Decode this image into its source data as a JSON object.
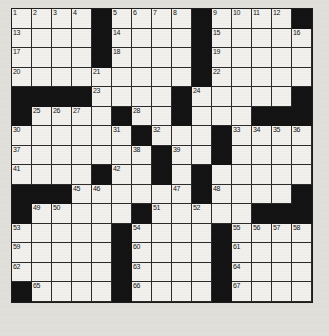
{
  "puzzle": {
    "type": "crossword-grid",
    "title": "Crossword Puzzle Grid",
    "columns": 15,
    "rows": 15,
    "colors": {
      "block": "#121212",
      "cell": "#f2f1ee",
      "page": "#e2e0db",
      "grid_line": "#2a2a2a",
      "number": "#111111"
    },
    "legend": {
      "white_cell": "letter cell",
      "black_cell": "block"
    },
    "max_clue_number": 67,
    "layout": [
      "WWWW.WWWW.WWWW.",
      "WWWW.WWWW.WWWWW",
      "WWWW.WWWW.WWWWW",
      "WWWWWWWWW.WWWWW",
      "....WWWW.WWWWW.",
      ".WWWW.WW.WWW...",
      "WWWWWW.WWW.WWWW",
      "WWWWWWW.WW.WWWW",
      "WWWW.WW.W.WWWWW",
      "...WWWWWW.WWWW.",
      ".WWWWW.WWWWW...",
      "WWWWW.WWWW.WWWW",
      "WWWWW.WWWW.WWWW",
      "WWWWW.WWWW.WWWW",
      ".WWWW.WWWW.WWWW"
    ],
    "numbers": [
      {
        "r": 0,
        "c": 0,
        "n": "1"
      },
      {
        "r": 0,
        "c": 1,
        "n": "2"
      },
      {
        "r": 0,
        "c": 2,
        "n": "3"
      },
      {
        "r": 0,
        "c": 3,
        "n": "4"
      },
      {
        "r": 0,
        "c": 5,
        "n": "5"
      },
      {
        "r": 0,
        "c": 6,
        "n": "6"
      },
      {
        "r": 0,
        "c": 7,
        "n": "7"
      },
      {
        "r": 0,
        "c": 8,
        "n": "8"
      },
      {
        "r": 0,
        "c": 10,
        "n": "9"
      },
      {
        "r": 0,
        "c": 11,
        "n": "10"
      },
      {
        "r": 0,
        "c": 12,
        "n": "11"
      },
      {
        "r": 0,
        "c": 13,
        "n": "12"
      },
      {
        "r": 1,
        "c": 0,
        "n": "13"
      },
      {
        "r": 1,
        "c": 5,
        "n": "14"
      },
      {
        "r": 1,
        "c": 10,
        "n": "15"
      },
      {
        "r": 1,
        "c": 14,
        "n": "16"
      },
      {
        "r": 2,
        "c": 0,
        "n": "17"
      },
      {
        "r": 2,
        "c": 5,
        "n": "18"
      },
      {
        "r": 2,
        "c": 10,
        "n": "19"
      },
      {
        "r": 3,
        "c": 0,
        "n": "20"
      },
      {
        "r": 3,
        "c": 4,
        "n": "21"
      },
      {
        "r": 3,
        "c": 10,
        "n": "22"
      },
      {
        "r": 4,
        "c": 4,
        "n": "23"
      },
      {
        "r": 4,
        "c": 9,
        "n": "24"
      },
      {
        "r": 5,
        "c": 1,
        "n": "25"
      },
      {
        "r": 5,
        "c": 2,
        "n": "26"
      },
      {
        "r": 5,
        "c": 3,
        "n": "27"
      },
      {
        "r": 5,
        "c": 6,
        "n": "28"
      },
      {
        "r": 5,
        "c": 8,
        "n": "29"
      },
      {
        "r": 6,
        "c": 0,
        "n": "30"
      },
      {
        "r": 6,
        "c": 5,
        "n": "31"
      },
      {
        "r": 6,
        "c": 7,
        "n": "32"
      },
      {
        "r": 6,
        "c": 11,
        "n": "33"
      },
      {
        "r": 6,
        "c": 12,
        "n": "34"
      },
      {
        "r": 6,
        "c": 13,
        "n": "35"
      },
      {
        "r": 6,
        "c": 14,
        "n": "36"
      },
      {
        "r": 7,
        "c": 0,
        "n": "37"
      },
      {
        "r": 7,
        "c": 6,
        "n": "38"
      },
      {
        "r": 7,
        "c": 8,
        "n": "39"
      },
      {
        "r": 7,
        "c": 10,
        "n": "40"
      },
      {
        "r": 8,
        "c": 0,
        "n": "41"
      },
      {
        "r": 8,
        "c": 5,
        "n": "42"
      },
      {
        "r": 8,
        "c": 7,
        "n": "43"
      },
      {
        "r": 8,
        "c": 9,
        "n": "44"
      },
      {
        "r": 9,
        "c": 3,
        "n": "45"
      },
      {
        "r": 9,
        "c": 4,
        "n": "46"
      },
      {
        "r": 9,
        "c": 8,
        "n": "47"
      },
      {
        "r": 9,
        "c": 10,
        "n": "48"
      },
      {
        "r": 10,
        "c": 1,
        "n": "49"
      },
      {
        "r": 10,
        "c": 2,
        "n": "50"
      },
      {
        "r": 10,
        "c": 7,
        "n": "51"
      },
      {
        "r": 10,
        "c": 9,
        "n": "52"
      },
      {
        "r": 11,
        "c": 0,
        "n": "53"
      },
      {
        "r": 11,
        "c": 6,
        "n": "54"
      },
      {
        "r": 11,
        "c": 11,
        "n": "55"
      },
      {
        "r": 11,
        "c": 12,
        "n": "56"
      },
      {
        "r": 11,
        "c": 13,
        "n": "57"
      },
      {
        "r": 11,
        "c": 14,
        "n": "58"
      },
      {
        "r": 12,
        "c": 0,
        "n": "59"
      },
      {
        "r": 12,
        "c": 6,
        "n": "60"
      },
      {
        "r": 12,
        "c": 11,
        "n": "61"
      },
      {
        "r": 13,
        "c": 0,
        "n": "62"
      },
      {
        "r": 13,
        "c": 6,
        "n": "63"
      },
      {
        "r": 13,
        "c": 11,
        "n": "64"
      },
      {
        "r": 14,
        "c": 1,
        "n": "65"
      },
      {
        "r": 14,
        "c": 6,
        "n": "66"
      },
      {
        "r": 14,
        "c": 11,
        "n": "67"
      }
    ]
  }
}
